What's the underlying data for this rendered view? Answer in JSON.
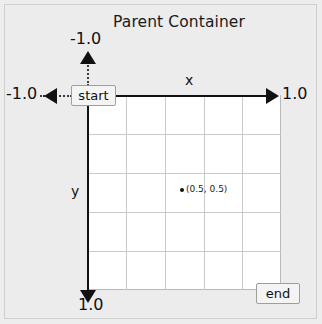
{
  "diagram": {
    "title": "Parent Container",
    "axes": {
      "x_name": "x",
      "y_name": "y",
      "x_min_label": "-1.0",
      "x_max_label": "1.0",
      "y_min_label": "-1.0",
      "y_max_label": "1.0"
    },
    "nodes": {
      "start_label": "start",
      "end_label": "end"
    },
    "point": {
      "label": "(0.5, 0.5)",
      "x": 0.5,
      "y": 0.5
    },
    "grid": {
      "columns": 5,
      "rows": 5
    },
    "colors": {
      "background": "#ededed",
      "plot_background": "#ffffff",
      "grid_line": "#c9c9c9",
      "axis": "#111111",
      "node_fill": "#f4f4f4",
      "node_border": "#9e9e9e"
    }
  }
}
